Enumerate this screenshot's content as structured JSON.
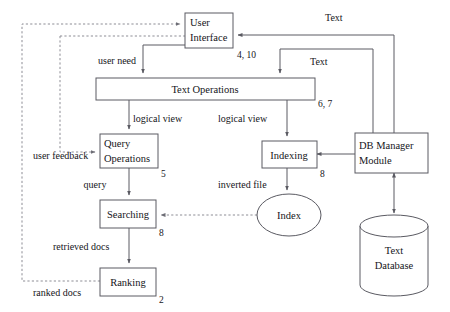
{
  "diagram": {
    "colors": {
      "stroke": "#5a5a62",
      "dashed_stroke": "#8d8d95",
      "text": "#15151a",
      "background": "#ffffff"
    },
    "nodes": [
      {
        "id": "user-interface",
        "label_line1": "User",
        "label_line2": "Interface",
        "shape": "rect"
      },
      {
        "id": "text-operations",
        "label_line1": "Text   Operations",
        "label_line2": "",
        "shape": "rect"
      },
      {
        "id": "query-operations",
        "label_line1": "Query",
        "label_line2": "Operations",
        "shape": "rect"
      },
      {
        "id": "indexing",
        "label_line1": "Indexing",
        "label_line2": "",
        "shape": "rect"
      },
      {
        "id": "db-manager",
        "label_line1": "DB Manager",
        "label_line2": "Module",
        "shape": "rect"
      },
      {
        "id": "searching",
        "label_line1": "Searching",
        "label_line2": "",
        "shape": "rect"
      },
      {
        "id": "ranking",
        "label_line1": "Ranking",
        "label_line2": "",
        "shape": "rect"
      },
      {
        "id": "index",
        "label_line1": "Index",
        "label_line2": "",
        "shape": "ellipse"
      },
      {
        "id": "text-database",
        "label_line1": "Text",
        "label_line2": "Database",
        "shape": "cylinder"
      }
    ],
    "step_numbers": [
      {
        "id": "step-user-interface",
        "value": "4, 10"
      },
      {
        "id": "step-text-operations",
        "value": "6, 7"
      },
      {
        "id": "step-query-operations",
        "value": "5"
      },
      {
        "id": "step-indexing",
        "value": "8"
      },
      {
        "id": "step-searching",
        "value": "8"
      },
      {
        "id": "step-ranking",
        "value": "2"
      }
    ],
    "edge_labels": [
      {
        "id": "label-text-top",
        "value": "Text"
      },
      {
        "id": "label-text-mid",
        "value": "Text"
      },
      {
        "id": "label-user-need",
        "value": "user need"
      },
      {
        "id": "label-logical-view-left",
        "value": "logical view"
      },
      {
        "id": "label-logical-view-right",
        "value": "logical view"
      },
      {
        "id": "label-user-feedback",
        "value": "user feedback"
      },
      {
        "id": "label-query",
        "value": "query"
      },
      {
        "id": "label-inverted-file",
        "value": "inverted file"
      },
      {
        "id": "label-retrieved-docs",
        "value": "retrieved docs"
      },
      {
        "id": "label-ranked-docs",
        "value": "ranked docs"
      }
    ]
  }
}
